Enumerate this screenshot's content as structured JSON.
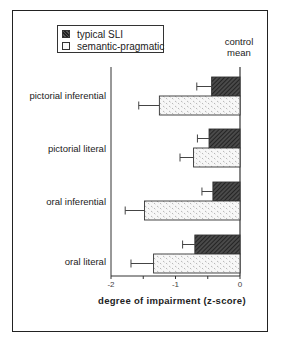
{
  "chart_data": {
    "type": "bar",
    "orientation": "horizontal",
    "title": "",
    "xlabel": "degree of impairment (z-score)",
    "ylabel": "",
    "xlim": [
      -2,
      0
    ],
    "x_ticks": [
      -2,
      -1,
      0
    ],
    "x_tick_labels": [
      "-2",
      "-1",
      "0"
    ],
    "annotation": "control mean",
    "categories": [
      "pictorial inferential",
      "pictorial literal",
      "oral inferential",
      "oral literal"
    ],
    "series": [
      {
        "name": "typical SLI",
        "values": [
          -0.44,
          -0.48,
          -0.42,
          -0.7
        ],
        "error_low": [
          -0.67,
          -0.66,
          -0.59,
          -0.89
        ],
        "fill": "dark hatched",
        "color": "#333333"
      },
      {
        "name": "semantic-pragmatic",
        "values": [
          -1.25,
          -0.72,
          -1.48,
          -1.34
        ],
        "error_low": [
          -1.57,
          -0.93,
          -1.78,
          -1.69
        ],
        "fill": "light dotted",
        "color": "#f2f2f2"
      }
    ],
    "legend_position": "top-left",
    "grid": false
  },
  "legend": {
    "items": [
      {
        "label": "typical SLI"
      },
      {
        "label": "semantic-pragmatic"
      }
    ]
  },
  "annotations": {
    "control_line1": "control",
    "control_line2": "mean"
  },
  "axis": {
    "xlabel": "degree of impairment (z-score)",
    "ticks": [
      "-2",
      "-1",
      "0"
    ]
  }
}
